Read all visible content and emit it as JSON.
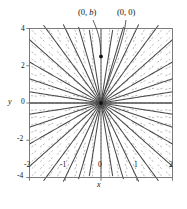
{
  "figure": {
    "background": "#ffffff",
    "frame_color": "#6e6e6e",
    "curve_color": "#4a4a4a",
    "field_color": "#9a9a9a",
    "axis_color": "#4a4a4a",
    "point_color": "#111111"
  },
  "annotations": {
    "point_b": {
      "text_pre": "(0, ",
      "text_var": "b",
      "text_post": ")",
      "full": "(0, b)"
    },
    "point_origin": {
      "full": "(0, 0)"
    }
  },
  "axes": {
    "x_label": "x",
    "y_label": "y",
    "x_ticks": [
      "-2",
      "-1",
      "0",
      "1",
      "2"
    ],
    "y_ticks": [
      "4",
      "2",
      "0",
      "-2",
      "-4"
    ]
  },
  "chart_data": {
    "type": "line",
    "title": "",
    "subtitle": "",
    "xlabel": "x",
    "ylabel": "y",
    "xlim": [
      -2,
      2
    ],
    "ylim": [
      -4,
      4
    ],
    "grid": false,
    "legend": null,
    "xticks": [
      -2,
      -1,
      0,
      1,
      2
    ],
    "yticks": [
      -4,
      -2,
      0,
      2,
      4
    ],
    "field": {
      "type": "slope_field",
      "equation": "dy/dx = y/x",
      "nx": 17,
      "ny": 21,
      "dash": true,
      "color": "#9a9a9a"
    },
    "series": [
      {
        "name": "m=0.00",
        "slope": 0.0,
        "color": "#4a4a4a"
      },
      {
        "name": "m=0.30",
        "slope": 0.3,
        "color": "#4a4a4a"
      },
      {
        "name": "m=-0.30",
        "slope": -0.3,
        "color": "#4a4a4a"
      },
      {
        "name": "m=0.65",
        "slope": 0.65,
        "color": "#4a4a4a"
      },
      {
        "name": "m=-0.65",
        "slope": -0.65,
        "color": "#4a4a4a"
      },
      {
        "name": "m=1.10",
        "slope": 1.1,
        "color": "#4a4a4a"
      },
      {
        "name": "m=-1.10",
        "slope": -1.1,
        "color": "#4a4a4a"
      },
      {
        "name": "m=1.70",
        "slope": 1.7,
        "color": "#4a4a4a"
      },
      {
        "name": "m=-1.70",
        "slope": -1.7,
        "color": "#4a4a4a"
      },
      {
        "name": "m=2.60",
        "slope": 2.6,
        "color": "#4a4a4a"
      },
      {
        "name": "m=-2.60",
        "slope": -2.6,
        "color": "#4a4a4a"
      },
      {
        "name": "m=4.00",
        "slope": 4.0,
        "color": "#4a4a4a"
      },
      {
        "name": "m=-4.00",
        "slope": -4.0,
        "color": "#4a4a4a"
      },
      {
        "name": "m=6.50",
        "slope": 6.5,
        "color": "#4a4a4a"
      },
      {
        "name": "m=-6.50",
        "slope": -6.5,
        "color": "#4a4a4a"
      },
      {
        "name": "m=12.0",
        "slope": 12.0,
        "color": "#4a4a4a"
      },
      {
        "name": "m=-12.0",
        "slope": -12.0,
        "color": "#4a4a4a"
      }
    ],
    "points": [
      {
        "label": "(0, b)",
        "x": 0,
        "y": 2.5
      },
      {
        "label": "(0, 0)",
        "x": 0,
        "y": 0
      }
    ]
  }
}
